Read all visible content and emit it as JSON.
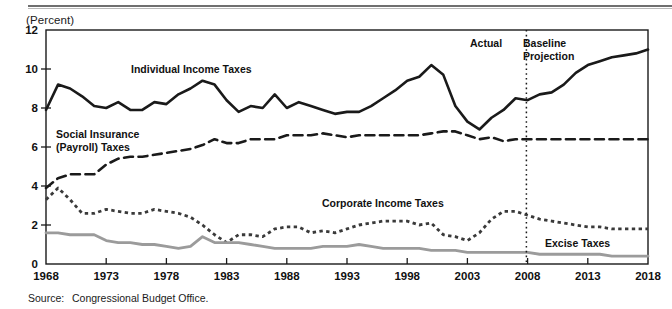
{
  "figure": {
    "y_axis_unit": "(Percent)",
    "source_label": "Source:",
    "source_text": "Congressional Budget Office."
  },
  "annotations": {
    "individual": "Individual Income Taxes",
    "social_line1": "Social Insurance",
    "social_line2": "(Payroll) Taxes",
    "corporate": "Corporate Income Taxes",
    "excise": "Excise Taxes",
    "actual": "Actual",
    "baseline_line1": "Baseline",
    "baseline_line2": "Projection"
  },
  "colors": {
    "individual": "#1a1a1a",
    "social": "#1a1a1a",
    "corporate": "#3a3a3a",
    "excise": "#9b9b9b",
    "frame": "#1a1a1a",
    "divider": "#1a1a1a"
  },
  "chart_data": {
    "type": "line",
    "title": "",
    "subtitle": "",
    "xlabel": "",
    "ylabel": "(Percent)",
    "xlim": [
      1968,
      2018
    ],
    "ylim": [
      0,
      12
    ],
    "yticks": [
      0,
      2,
      4,
      6,
      8,
      10,
      12
    ],
    "xticks": [
      1968,
      1973,
      1978,
      1983,
      1988,
      1993,
      1998,
      2003,
      2008,
      2013,
      2018
    ],
    "grid": false,
    "legend": "inline-annotations",
    "projection_start": 2007.9,
    "x": [
      1968,
      1969,
      1970,
      1971,
      1972,
      1973,
      1974,
      1975,
      1976,
      1977,
      1978,
      1979,
      1980,
      1981,
      1982,
      1983,
      1984,
      1985,
      1986,
      1987,
      1988,
      1989,
      1990,
      1991,
      1992,
      1993,
      1994,
      1995,
      1996,
      1997,
      1998,
      1999,
      2000,
      2001,
      2002,
      2003,
      2004,
      2005,
      2006,
      2007,
      2008,
      2009,
      2010,
      2011,
      2012,
      2013,
      2014,
      2015,
      2016,
      2017,
      2018
    ],
    "series": [
      {
        "name": "Individual Income Taxes",
        "style": "solid",
        "color": "#1a1a1a",
        "values": [
          7.9,
          9.2,
          9.0,
          8.6,
          8.1,
          8.0,
          8.3,
          7.9,
          7.9,
          8.3,
          8.2,
          8.7,
          9.0,
          9.4,
          9.2,
          8.4,
          7.8,
          8.1,
          8.0,
          8.7,
          8.0,
          8.3,
          8.1,
          7.9,
          7.7,
          7.8,
          7.8,
          8.1,
          8.5,
          8.9,
          9.4,
          9.6,
          10.2,
          9.7,
          8.1,
          7.3,
          6.9,
          7.5,
          7.9,
          8.5,
          8.4,
          8.7,
          8.8,
          9.2,
          9.8,
          10.2,
          10.4,
          10.6,
          10.7,
          10.8,
          11.0
        ]
      },
      {
        "name": "Social Insurance (Payroll) Taxes",
        "style": "dashed",
        "color": "#1a1a1a",
        "values": [
          3.9,
          4.4,
          4.6,
          4.6,
          4.6,
          5.1,
          5.4,
          5.5,
          5.5,
          5.6,
          5.7,
          5.8,
          5.9,
          6.1,
          6.4,
          6.2,
          6.2,
          6.4,
          6.4,
          6.4,
          6.6,
          6.6,
          6.6,
          6.7,
          6.6,
          6.5,
          6.6,
          6.6,
          6.6,
          6.6,
          6.6,
          6.6,
          6.7,
          6.8,
          6.8,
          6.6,
          6.4,
          6.5,
          6.3,
          6.4,
          6.4,
          6.4,
          6.4,
          6.4,
          6.4,
          6.4,
          6.4,
          6.4,
          6.4,
          6.4,
          6.4
        ]
      },
      {
        "name": "Corporate Income Taxes",
        "style": "dotted",
        "color": "#3a3a3a",
        "values": [
          3.3,
          3.9,
          3.3,
          2.6,
          2.6,
          2.8,
          2.7,
          2.6,
          2.6,
          2.8,
          2.7,
          2.6,
          2.4,
          2.0,
          1.5,
          1.1,
          1.5,
          1.5,
          1.4,
          1.8,
          1.9,
          1.9,
          1.6,
          1.7,
          1.6,
          1.8,
          2.0,
          2.1,
          2.2,
          2.2,
          2.2,
          2.0,
          2.1,
          1.5,
          1.4,
          1.2,
          1.6,
          2.3,
          2.7,
          2.7,
          2.5,
          2.3,
          2.2,
          2.1,
          2.0,
          1.9,
          1.9,
          1.8,
          1.8,
          1.8,
          1.8
        ]
      },
      {
        "name": "Excise Taxes",
        "style": "solid-gray",
        "color": "#9b9b9b",
        "values": [
          1.6,
          1.6,
          1.5,
          1.5,
          1.5,
          1.2,
          1.1,
          1.1,
          1.0,
          1.0,
          0.9,
          0.8,
          0.9,
          1.4,
          1.1,
          1.1,
          1.1,
          1.0,
          0.9,
          0.8,
          0.8,
          0.8,
          0.8,
          0.9,
          0.9,
          0.9,
          1.0,
          0.9,
          0.8,
          0.8,
          0.8,
          0.8,
          0.7,
          0.7,
          0.7,
          0.6,
          0.6,
          0.6,
          0.6,
          0.6,
          0.6,
          0.5,
          0.5,
          0.5,
          0.5,
          0.5,
          0.5,
          0.4,
          0.4,
          0.4,
          0.4
        ]
      }
    ]
  }
}
